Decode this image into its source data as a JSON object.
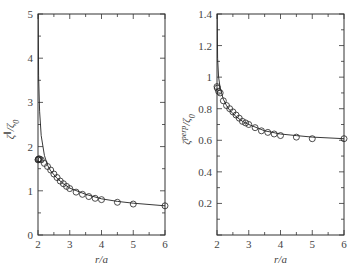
{
  "chart_data": [
    {
      "type": "scatter",
      "title": "",
      "xlabel": "r/a",
      "ylabel": "ζ∥/ζ0",
      "xlim": [
        2,
        6
      ],
      "ylim": [
        0,
        5
      ],
      "xticks": [
        2,
        3,
        4,
        5,
        6
      ],
      "yticks": [
        0,
        1,
        2,
        3,
        4,
        5
      ],
      "grid": false,
      "series": [
        {
          "name": "simulation",
          "marker": "open-circle",
          "x": [
            2.0,
            2.01,
            2.02,
            2.05,
            2.1,
            2.2,
            2.3,
            2.4,
            2.5,
            2.6,
            2.7,
            2.8,
            2.9,
            3.0,
            3.2,
            3.4,
            3.6,
            3.8,
            4.0,
            4.5,
            5.0,
            6.0
          ],
          "y": [
            1.7,
            1.71,
            1.72,
            1.72,
            1.7,
            1.62,
            1.55,
            1.47,
            1.38,
            1.3,
            1.22,
            1.16,
            1.1,
            1.05,
            0.97,
            0.92,
            0.87,
            0.83,
            0.8,
            0.74,
            0.7,
            0.66
          ]
        },
        {
          "name": "theory",
          "style": "solid-line",
          "x": [
            2.005,
            2.02,
            2.05,
            2.1,
            2.2,
            2.3,
            2.4,
            2.6,
            2.8,
            3.0,
            3.5,
            4.0,
            4.5,
            5.0,
            6.0
          ],
          "y": [
            5.0,
            3.6,
            2.8,
            2.25,
            1.8,
            1.58,
            1.45,
            1.28,
            1.16,
            1.06,
            0.92,
            0.82,
            0.76,
            0.72,
            0.66
          ]
        }
      ]
    },
    {
      "type": "scatter",
      "title": "",
      "xlabel": "r/a",
      "ylabel": "ζperp/ζ0",
      "xlim": [
        2,
        6
      ],
      "ylim": [
        0,
        1.4
      ],
      "xticks": [
        2,
        3,
        4,
        5,
        6
      ],
      "yticks": [
        0.2,
        0.4,
        0.6,
        0.8,
        1,
        1.2,
        1.4
      ],
      "grid": false,
      "series": [
        {
          "name": "simulation",
          "marker": "open-circle",
          "x": [
            2.0,
            2.01,
            2.05,
            2.1,
            2.2,
            2.3,
            2.4,
            2.5,
            2.6,
            2.7,
            2.8,
            2.9,
            3.0,
            3.2,
            3.4,
            3.6,
            3.8,
            4.0,
            4.5,
            5.0,
            6.0
          ],
          "y": [
            0.94,
            0.93,
            0.91,
            0.9,
            0.85,
            0.82,
            0.8,
            0.78,
            0.76,
            0.74,
            0.72,
            0.71,
            0.7,
            0.68,
            0.66,
            0.65,
            0.64,
            0.63,
            0.62,
            0.61,
            0.61
          ]
        },
        {
          "name": "theory",
          "style": "solid-line",
          "x": [
            2.005,
            2.02,
            2.05,
            2.1,
            2.2,
            2.3,
            2.4,
            2.6,
            2.8,
            3.0,
            3.5,
            4.0,
            4.5,
            5.0,
            6.0
          ],
          "y": [
            1.4,
            1.12,
            1.0,
            0.93,
            0.86,
            0.82,
            0.79,
            0.75,
            0.72,
            0.7,
            0.66,
            0.64,
            0.63,
            0.62,
            0.61
          ]
        }
      ]
    }
  ],
  "panels": [
    {
      "xlabel": "r/a",
      "ylabel_base": "ζ",
      "ylabel_sup": "∥",
      "ylabel_rest": "/ζ",
      "ylabel_sub": "0",
      "xtick_labels": [
        "2",
        "3",
        "4",
        "5",
        "6"
      ],
      "ytick_labels": [
        "0",
        "1",
        "2",
        "3",
        "4",
        "5"
      ]
    },
    {
      "xlabel": "r/a",
      "ylabel_base": "ζ",
      "ylabel_sup": "perp",
      "ylabel_rest": "/ζ",
      "ylabel_sub": "0",
      "xtick_labels": [
        "2",
        "3",
        "4",
        "5",
        "6"
      ],
      "ytick_labels": [
        "0.2",
        "0.4",
        "0.6",
        "0.8",
        "1",
        "1.2",
        "1.4"
      ]
    }
  ]
}
